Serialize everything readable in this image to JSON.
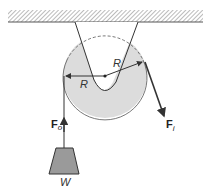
{
  "diagram": {
    "labels": {
      "radius_left": "R",
      "radius_right": "R",
      "force_out": "F",
      "force_out_sub": "o",
      "force_in": "F",
      "force_in_sub": "i",
      "weight": "W"
    },
    "colors": {
      "pulley_fill": "#dcdcdc",
      "weight_fill": "#9a9a9a",
      "line": "#333333",
      "hatch": "#888888"
    }
  }
}
